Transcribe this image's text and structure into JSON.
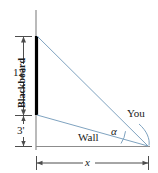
{
  "figure": {
    "labels": {
      "height_upper": "12'",
      "height_lower": "3'",
      "board": "Blackboard",
      "baseline": "Wall",
      "viewer": "You",
      "angle": "α",
      "distance": "x"
    },
    "colors": {
      "board": "#000000",
      "sight_lines": "#7fa3c0",
      "dimension": "#4d4d4d",
      "wall_line": "#808080",
      "text": "#1a1a1a"
    },
    "geometry": {
      "wall_x": 36,
      "wall_top_y": 10,
      "board_top_y": 36,
      "board_bottom_y": 115,
      "floor_y": 146,
      "viewer_x": 148,
      "viewer_y": 146
    }
  }
}
